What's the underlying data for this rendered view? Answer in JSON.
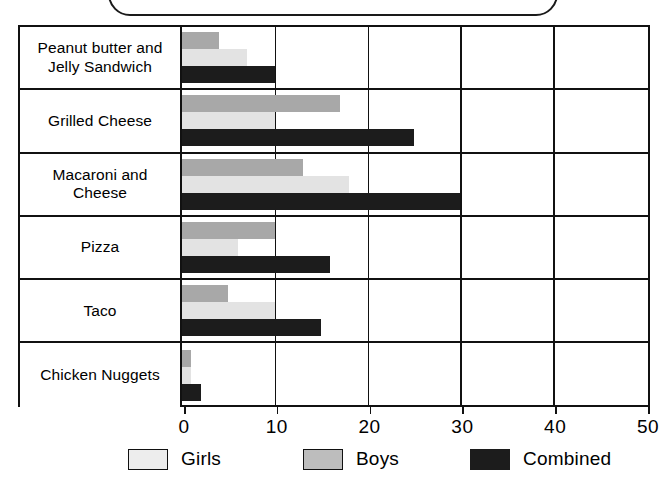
{
  "top_box": {
    "content": ""
  },
  "legend": {
    "items": [
      {
        "label": "Girls",
        "key": "girls",
        "color": "#ededed"
      },
      {
        "label": "Boys",
        "key": "boys",
        "color": "#bdbdbd"
      },
      {
        "label": "Combined",
        "key": "combined",
        "color": "#1c1c1c"
      }
    ]
  },
  "axis": {
    "ticks": [
      {
        "label": "0",
        "value": 0
      },
      {
        "label": "10",
        "value": 10
      },
      {
        "label": "20",
        "value": 20
      },
      {
        "label": "30",
        "value": 30
      },
      {
        "label": "40",
        "value": 40
      },
      {
        "label": "50",
        "value": 50
      }
    ]
  },
  "rows": [
    {
      "label": "Peanut butter and Jelly Sandwich"
    },
    {
      "label": "Grilled Cheese"
    },
    {
      "label": "Macaroni and Cheese"
    },
    {
      "label": "Pizza"
    },
    {
      "label": "Taco"
    },
    {
      "label": "Chicken Nuggets"
    }
  ],
  "footer_artifact": {
    "text": ""
  },
  "chart_data": {
    "type": "bar",
    "orientation": "horizontal",
    "title": "",
    "xlabel": "",
    "ylabel": "",
    "xlim": [
      0,
      50
    ],
    "xticks": [
      0,
      10,
      20,
      30,
      40,
      50
    ],
    "grid": true,
    "legend_position": "bottom",
    "categories": [
      "Peanut butter and Jelly Sandwich",
      "Grilled Cheese",
      "Macaroni and Cheese",
      "Pizza",
      "Taco",
      "Chicken Nuggets"
    ],
    "series": [
      {
        "name": "Boys",
        "color": "#a8a8a8",
        "values": [
          4,
          17,
          13,
          10,
          5,
          1
        ]
      },
      {
        "name": "Girls",
        "color": "#e3e3e3",
        "values": [
          7,
          10,
          18,
          6,
          10,
          1
        ]
      },
      {
        "name": "Combined",
        "color": "#1c1c1c",
        "values": [
          10,
          25,
          30,
          16,
          15,
          2
        ]
      }
    ]
  }
}
